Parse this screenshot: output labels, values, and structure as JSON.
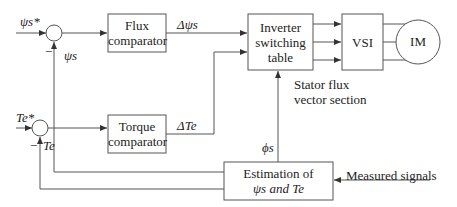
{
  "diagram": {
    "blocks": {
      "flux_comparator": [
        "Flux",
        "comparator"
      ],
      "torque_comparator": [
        "Torque",
        "comparator"
      ],
      "inverter_table": [
        "Inverter",
        "switching",
        "table"
      ],
      "vsi": "VSI",
      "motor": "IM",
      "estimation": [
        "Estimation of",
        "ψs and Te"
      ]
    },
    "signals": {
      "flux_ref": "ψs*",
      "flux_fb": "ψs",
      "flux_err": "Δψs",
      "torque_ref": "Te*",
      "torque_fb": "Te",
      "torque_err": "ΔTe",
      "sector": "ϕs",
      "minus_flux": "−",
      "minus_torque": "−",
      "measured": "Measured signals",
      "sector_note": [
        "Stator flux",
        "vector section"
      ]
    },
    "stroke_color": "#555555"
  }
}
